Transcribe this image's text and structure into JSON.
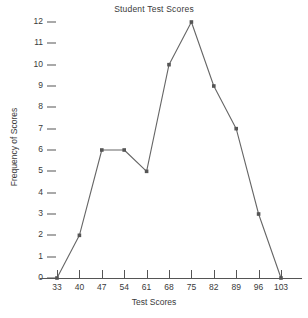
{
  "chart_data": {
    "type": "line",
    "title": "Student Test Scores",
    "xlabel": "Test Scores",
    "ylabel": "Frequency of Scores",
    "x": [
      33,
      40,
      47,
      54,
      61,
      68,
      75,
      82,
      89,
      96,
      103
    ],
    "values": [
      0,
      2,
      6,
      6,
      5,
      10,
      12,
      9,
      7,
      3,
      0
    ],
    "xticks": [
      33,
      40,
      47,
      54,
      61,
      68,
      75,
      82,
      89,
      96,
      103
    ],
    "yticks": [
      0,
      1,
      2,
      3,
      4,
      5,
      6,
      7,
      8,
      9,
      10,
      11,
      12
    ],
    "xlim": [
      33,
      103
    ],
    "ylim": [
      0,
      12
    ],
    "grid": false,
    "legend": false,
    "marker": "square",
    "line_color": "#666666",
    "marker_color": "#555555",
    "axis_color": "#555555",
    "text_color": "#3a3a3a",
    "background": "#ffffff"
  }
}
